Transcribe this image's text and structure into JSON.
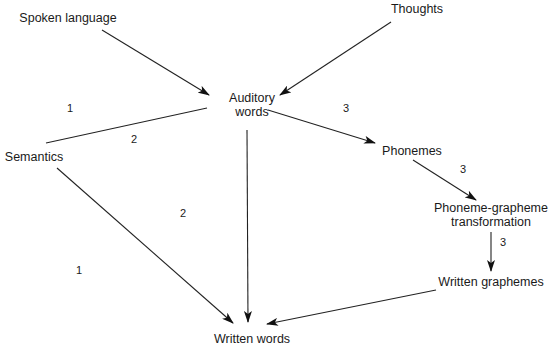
{
  "nodes": [
    {
      "id": "spoken",
      "lines": [
        "Spoken language"
      ]
    },
    {
      "id": "thoughts",
      "lines": [
        "Thoughts"
      ]
    },
    {
      "id": "auditory",
      "lines": [
        "Auditory",
        "words"
      ]
    },
    {
      "id": "semantics",
      "lines": [
        "Semantics"
      ]
    },
    {
      "id": "phonemes",
      "lines": [
        "Phonemes"
      ]
    },
    {
      "id": "pgt",
      "lines": [
        "Phoneme-grapheme",
        "transformation"
      ]
    },
    {
      "id": "graphemes",
      "lines": [
        "Written graphemes"
      ]
    },
    {
      "id": "written",
      "lines": [
        "Written words"
      ]
    }
  ],
  "edges": [
    {
      "from": "spoken",
      "to": "auditory",
      "arrow": true
    },
    {
      "from": "thoughts",
      "to": "auditory",
      "arrow": true
    },
    {
      "from": "auditory",
      "to": "semantics",
      "arrow": false
    },
    {
      "from": "auditory",
      "to": "phonemes",
      "arrow": true
    },
    {
      "from": "auditory",
      "to": "written",
      "arrow": true
    },
    {
      "from": "semantics",
      "to": "written",
      "arrow": true
    },
    {
      "from": "phonemes",
      "to": "pgt",
      "arrow": true
    },
    {
      "from": "pgt",
      "to": "graphemes",
      "arrow": true
    },
    {
      "from": "graphemes",
      "to": "written",
      "arrow": true
    }
  ],
  "route_labels": [
    "1",
    "2",
    "3",
    "3",
    "2",
    "1",
    "3"
  ]
}
